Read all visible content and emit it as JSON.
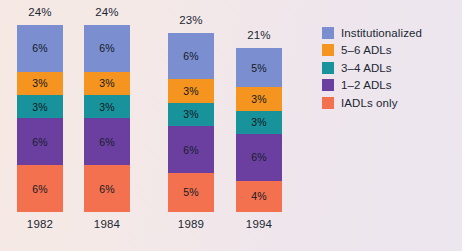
{
  "chart_data": {
    "type": "bar",
    "subtype": "stacked-bar",
    "title": "",
    "xlabel": "",
    "ylabel": "",
    "ylim": [
      0,
      24
    ],
    "grid": false,
    "legend_position": "right",
    "categories": [
      "1982",
      "1984",
      "1989",
      "1994"
    ],
    "totals": [
      "24%",
      "24%",
      "23%",
      "21%"
    ],
    "totals_values": [
      24,
      24,
      23,
      21
    ],
    "series": [
      {
        "name": "Institutionalized",
        "color": "#7b8ed0",
        "values": [
          6,
          6,
          6,
          5
        ],
        "labels": [
          "6%",
          "6%",
          "6%",
          "5%"
        ]
      },
      {
        "name": "5–6 ADLs",
        "color": "#f5941f",
        "values": [
          3,
          3,
          3,
          3
        ],
        "labels": [
          "3%",
          "3%",
          "3%",
          "3%"
        ]
      },
      {
        "name": "3–4 ADLs",
        "color": "#18939b",
        "values": [
          3,
          3,
          3,
          3
        ],
        "labels": [
          "3%",
          "3%",
          "3%",
          "3%"
        ]
      },
      {
        "name": "1–2 ADLs",
        "color": "#6b3fa0",
        "values": [
          6,
          6,
          6,
          6
        ],
        "labels": [
          "6%",
          "6%",
          "6%",
          "6%"
        ]
      },
      {
        "name": "IADLs only",
        "color": "#f4714f",
        "values": [
          6,
          6,
          5,
          4
        ],
        "labels": [
          "6%",
          "6%",
          "5%",
          "4%"
        ]
      }
    ]
  },
  "legend": {
    "items": [
      {
        "label": "Institutionalized",
        "color": "#7b8ed0"
      },
      {
        "label": "5–6 ADLs",
        "color": "#f5941f"
      },
      {
        "label": "3–4 ADLs",
        "color": "#18939b"
      },
      {
        "label": "1–2 ADLs",
        "color": "#6b3fa0"
      },
      {
        "label": "IADLs only",
        "color": "#f4714f"
      }
    ]
  },
  "style": {
    "background": "#f1e7e6",
    "text_color": "#1b2733"
  }
}
